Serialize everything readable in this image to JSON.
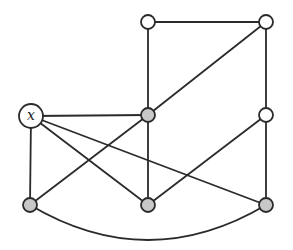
{
  "diagram": {
    "type": "graph",
    "colors": {
      "shaded": "#c8c8c8",
      "unshaded": "#ffffff",
      "stroke": "#2a2a2a"
    },
    "nodes": [
      {
        "id": "x",
        "label": "x",
        "cx": 31,
        "cy": 116,
        "r": 12,
        "shaded": false
      },
      {
        "id": "top-left",
        "label": "",
        "cx": 148,
        "cy": 22,
        "r": 7,
        "shaded": false
      },
      {
        "id": "top-right",
        "label": "",
        "cx": 266,
        "cy": 22,
        "r": 7,
        "shaded": false
      },
      {
        "id": "mid-center",
        "label": "",
        "cx": 148,
        "cy": 115,
        "r": 7,
        "shaded": true
      },
      {
        "id": "mid-right",
        "label": "",
        "cx": 266,
        "cy": 115,
        "r": 7,
        "shaded": false
      },
      {
        "id": "bottom-left",
        "label": "",
        "cx": 30,
        "cy": 205,
        "r": 7,
        "shaded": true
      },
      {
        "id": "bottom-center",
        "label": "",
        "cx": 148,
        "cy": 205,
        "r": 7,
        "shaded": true
      },
      {
        "id": "bottom-right",
        "label": "",
        "cx": 266,
        "cy": 205,
        "r": 7,
        "shaded": true
      }
    ],
    "edges": [
      {
        "from": "top-left",
        "to": "top-right"
      },
      {
        "from": "top-left",
        "to": "mid-center"
      },
      {
        "from": "top-right",
        "to": "mid-right"
      },
      {
        "from": "top-right",
        "to": "mid-center"
      },
      {
        "from": "x",
        "to": "mid-center"
      },
      {
        "from": "x",
        "to": "bottom-left"
      },
      {
        "from": "x",
        "to": "bottom-center"
      },
      {
        "from": "x",
        "to": "bottom-right"
      },
      {
        "from": "mid-center",
        "to": "bottom-left"
      },
      {
        "from": "mid-center",
        "to": "bottom-center"
      },
      {
        "from": "mid-right",
        "to": "bottom-center"
      },
      {
        "from": "mid-right",
        "to": "bottom-right"
      },
      {
        "from": "bottom-left",
        "to": "bottom-right",
        "curved": true
      }
    ]
  }
}
